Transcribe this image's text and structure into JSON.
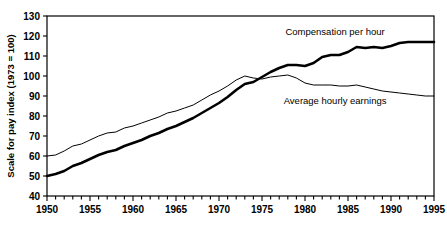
{
  "chart_data": {
    "type": "line",
    "title": "",
    "xlabel": "",
    "ylabel": "Scale for pay index (1973 = 100)",
    "xlim": [
      1950,
      1995
    ],
    "ylim": [
      40,
      130
    ],
    "ytick_step": 10,
    "xtick_major_step": 5,
    "xtick_minor_step": 1,
    "grid": false,
    "legend_position": "inline-annotations",
    "yticks": [
      40,
      50,
      60,
      70,
      80,
      90,
      100,
      110,
      120,
      130
    ],
    "xticks": [
      1950,
      1955,
      1960,
      1965,
      1970,
      1975,
      1980,
      1985,
      1990,
      1995
    ],
    "x": [
      1950,
      1951,
      1952,
      1953,
      1954,
      1955,
      1956,
      1957,
      1958,
      1959,
      1960,
      1961,
      1962,
      1963,
      1964,
      1965,
      1966,
      1967,
      1968,
      1969,
      1970,
      1971,
      1972,
      1973,
      1974,
      1975,
      1976,
      1977,
      1978,
      1979,
      1980,
      1981,
      1982,
      1983,
      1984,
      1985,
      1986,
      1987,
      1988,
      1989,
      1990,
      1991,
      1992,
      1993,
      1994,
      1995
    ],
    "series": [
      {
        "name": "Compensation per hour",
        "annotation": "Compensation per hour",
        "annotation_x": 1983.5,
        "annotation_y": 120.5,
        "line_width": 2.6,
        "color": "#000000",
        "values": [
          50.0,
          51.0,
          52.5,
          55.0,
          56.5,
          58.5,
          60.5,
          62.0,
          63.0,
          65.0,
          66.5,
          68.0,
          70.0,
          71.5,
          73.5,
          75.0,
          77.0,
          79.0,
          81.5,
          84.0,
          86.5,
          89.5,
          93.0,
          96.0,
          97.0,
          99.5,
          102.0,
          104.0,
          105.5,
          105.5,
          105.0,
          106.5,
          109.5,
          110.5,
          110.5,
          112.0,
          114.5,
          114.0,
          114.5,
          114.0,
          115.0,
          116.5,
          117.0,
          117.0,
          117.0,
          117.0
        ]
      },
      {
        "name": "Average hourly earnings",
        "annotation": "Average hourly earnings",
        "annotation_x": 1983.5,
        "annotation_y": 86.0,
        "line_width": 1.0,
        "color": "#000000",
        "values": [
          60.0,
          60.5,
          62.5,
          65.0,
          66.0,
          68.0,
          70.0,
          71.5,
          72.0,
          74.0,
          75.0,
          76.5,
          78.0,
          79.5,
          81.5,
          82.5,
          84.0,
          85.5,
          88.0,
          90.5,
          92.5,
          95.0,
          98.0,
          100.0,
          99.0,
          98.5,
          99.5,
          100.0,
          100.5,
          99.0,
          96.5,
          95.5,
          95.5,
          95.5,
          95.0,
          95.0,
          95.5,
          94.5,
          93.5,
          92.5,
          92.0,
          91.5,
          91.0,
          90.5,
          90.0,
          90.0
        ]
      }
    ]
  }
}
